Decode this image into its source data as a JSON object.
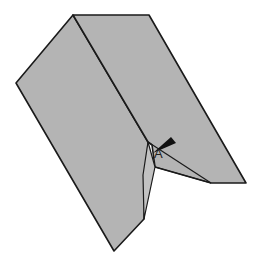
{
  "diagram": {
    "type": "origami-fold-step",
    "fill_color": "#b4b4b4",
    "stroke_color": "#1a1a1a",
    "labels": [
      {
        "text": "A",
        "x": 154,
        "y": 148
      }
    ],
    "arrow": {
      "description": "black wedge arrow pointing into fold at A"
    }
  }
}
